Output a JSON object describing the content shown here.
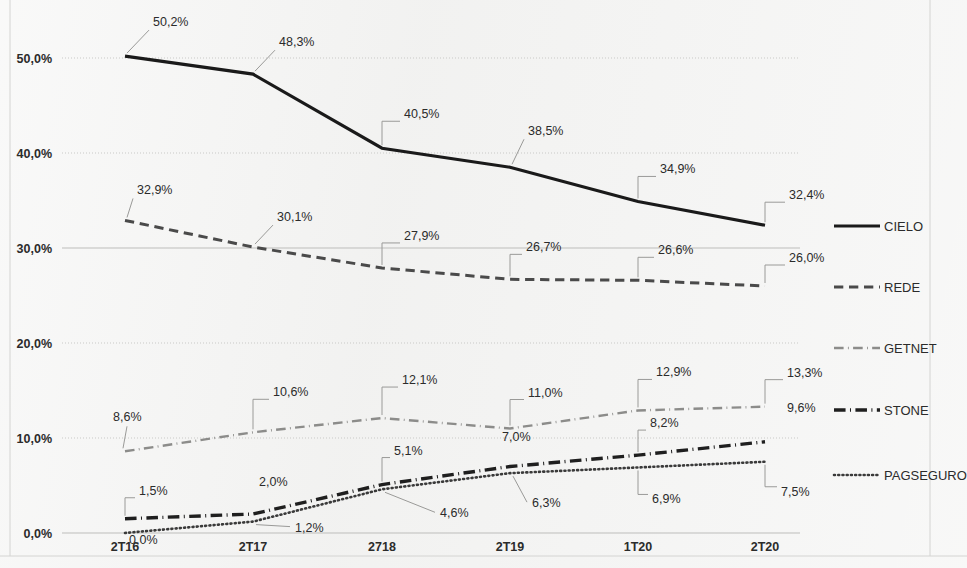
{
  "chart_data": {
    "type": "line",
    "title": "",
    "xlabel": "",
    "ylabel": "",
    "categories": [
      "2T16",
      "2T17",
      "2718",
      "2T19",
      "1T20",
      "2T20"
    ],
    "ylim": [
      0,
      55
    ],
    "yticks": [
      0,
      10,
      20,
      30,
      40,
      50
    ],
    "ytick_labels": [
      "0,0%",
      "10,0%",
      "20,0%",
      "30,0%",
      "40,0%",
      "50,0%"
    ],
    "grid": true,
    "legend_position": "right",
    "series": [
      {
        "name": "CIELO",
        "style": "solid",
        "color": "#1a1a1a",
        "width": 3.2,
        "values": [
          50.2,
          48.3,
          40.5,
          38.5,
          34.9,
          32.4
        ],
        "labels": [
          "50,2%",
          "48,3%",
          "40,5%",
          "38,5%",
          "34,9%",
          "32,4%"
        ]
      },
      {
        "name": "REDE",
        "style": "dashed",
        "color": "#4a4a4a",
        "width": 3.0,
        "values": [
          32.9,
          30.1,
          27.9,
          26.7,
          26.6,
          26.0
        ],
        "labels": [
          "32,9%",
          "30,1%",
          "27,9%",
          "26,7%",
          "26,6%",
          "26,0%"
        ]
      },
      {
        "name": "GETNET",
        "style": "dashdot-light",
        "color": "#8c8c8a",
        "width": 2.4,
        "values": [
          8.6,
          10.6,
          12.1,
          11.0,
          12.9,
          13.3
        ],
        "labels": [
          "8,6%",
          "10,6%",
          "12,1%",
          "11,0%",
          "12,9%",
          "13,3%"
        ]
      },
      {
        "name": "STONE",
        "style": "dashdot-bold",
        "color": "#1f1f1f",
        "width": 3.4,
        "values": [
          1.5,
          2.0,
          5.1,
          7.0,
          8.2,
          9.6
        ],
        "labels": [
          "1,5%",
          "2,0%",
          "5,1%",
          "7,0%",
          "8,2%",
          "9,6%"
        ]
      },
      {
        "name": "PAGSEGURO",
        "style": "dotted",
        "color": "#3a3a3a",
        "width": 2.6,
        "values": [
          0.0,
          1.2,
          4.6,
          6.3,
          6.9,
          7.5
        ],
        "labels": [
          "0,0%",
          "1,2%",
          "4,6%",
          "6,3%",
          "6,9%",
          "7,5%"
        ]
      }
    ]
  },
  "legend": {
    "items": [
      {
        "label": "CIELO",
        "style": "solid"
      },
      {
        "label": "REDE",
        "style": "dashed"
      },
      {
        "label": "GETNET",
        "style": "dashdot-light"
      },
      {
        "label": "STONE",
        "style": "dashdot-bold"
      },
      {
        "label": "PAGSEGURO",
        "style": "dotted"
      }
    ]
  }
}
